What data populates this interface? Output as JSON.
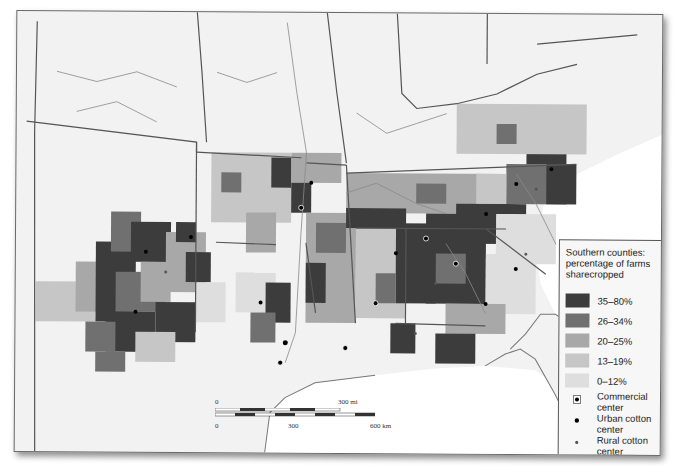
{
  "map": {
    "title": "Southern counties: percentage of farms sharecropped",
    "background_color": "#f2f2f2",
    "water_color": "#ffffff",
    "border_color": "#555555",
    "river_color": "#8a8a8a"
  },
  "legend": {
    "title": "Southern counties: percentage of farms sharecropped",
    "classes": [
      {
        "label": "35–80%",
        "color": "#3c3c3c"
      },
      {
        "label": "26–34%",
        "color": "#707070"
      },
      {
        "label": "20–25%",
        "color": "#a8a8a8"
      },
      {
        "label": "13–19%",
        "color": "#c6c6c6"
      },
      {
        "label": "0–12%",
        "color": "#dedede"
      }
    ],
    "symbols": [
      {
        "icon": "commercial-center-icon",
        "label": "Commercial center"
      },
      {
        "icon": "urban-cotton-center-icon",
        "label": "Urban cotton center"
      },
      {
        "icon": "rural-cotton-center-icon",
        "label": "Rural cotton center"
      }
    ]
  },
  "scale_bar": {
    "mi_start": "0",
    "mi_end": "300 mi",
    "km_start": "0",
    "km_mid": "300",
    "km_end": "600 km"
  }
}
